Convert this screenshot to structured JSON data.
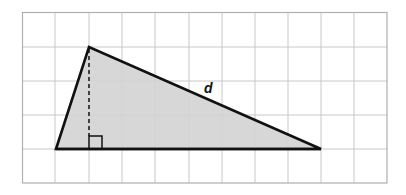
{
  "diagram": {
    "type": "triangle-on-grid",
    "grid": {
      "columns": 11,
      "rows": 5,
      "line_color": "#c8c8c8",
      "border_color": "#b0b0b0"
    },
    "triangle": {
      "fill": "#d4d4d4",
      "stroke": "#111111",
      "vertices_grid": [
        [
          1,
          4
        ],
        [
          2,
          1
        ],
        [
          9,
          4
        ]
      ],
      "height_line": "dashed",
      "right_angle_marker": true
    },
    "labels": {
      "hypotenuse": "d"
    }
  }
}
